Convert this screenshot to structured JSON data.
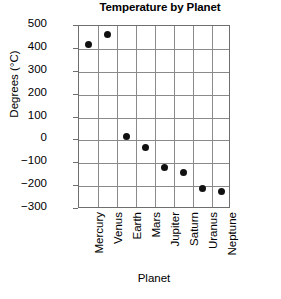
{
  "chart_data": {
    "type": "scatter",
    "title": "Temperature by Planet",
    "xlabel": "Planet",
    "ylabel": "Degrees (°C)",
    "categories": [
      "Mercury",
      "Venus",
      "Earth",
      "Mars",
      "Jupiter",
      "Saturn",
      "Uranus",
      "Neptune"
    ],
    "values": [
      420,
      465,
      15,
      -30,
      -120,
      -140,
      -210,
      -225
    ],
    "ylim": [
      -300,
      500
    ],
    "ytick_labels": [
      "500",
      "400",
      "300",
      "200",
      "100",
      "0",
      "−100",
      "−200",
      "−300"
    ],
    "ytick_values": [
      500,
      400,
      300,
      200,
      100,
      0,
      -100,
      -200,
      -300
    ],
    "grid": true,
    "legend": "none",
    "marker_color": "#111111",
    "grid_color": "#8a8a8a",
    "frame_color": "#6e6e6e"
  }
}
